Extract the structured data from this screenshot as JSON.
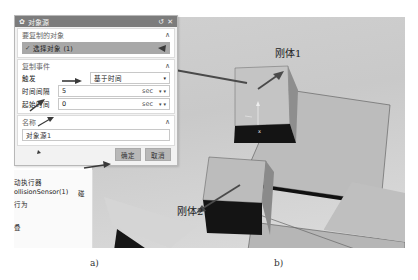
{
  "dialog": {
    "title": "对象源",
    "icons": {
      "gear": "gear-icon",
      "reset": "reset-icon",
      "close": "close-icon"
    },
    "sections": {
      "copy_object": {
        "header": "要复制的对象",
        "select_label": "选择对象 (1)"
      },
      "copy_event": {
        "header": "复制事件",
        "trigger_label": "触发",
        "trigger_value": "基于时间",
        "interval_label": "时间间隔",
        "interval_value": "5",
        "interval_unit": "sec",
        "start_label": "起始时间",
        "start_value": "0",
        "start_unit": "sec"
      },
      "name": {
        "header": "名称",
        "value": "对象源1"
      }
    },
    "buttons": {
      "ok": "确定",
      "cancel": "取消"
    }
  },
  "tree": {
    "items": [
      "动执行器",
      "ollisionSensor(1)",
      "行为",
      "",
      "叠"
    ],
    "extra": "碰"
  },
  "scene": {
    "label1": "刚体1",
    "label2": "刚体2",
    "axis_label": "x"
  },
  "captions": {
    "a": "a)",
    "b": "b)"
  },
  "colors": {
    "titlebar": "#7c7c7c",
    "selected_row": "#a8a8a8",
    "viewport_bg": "#cfcfcf",
    "cube_top": "#bdbdbd",
    "cube_front": "#161616",
    "arrow": "#4a4a4a"
  }
}
